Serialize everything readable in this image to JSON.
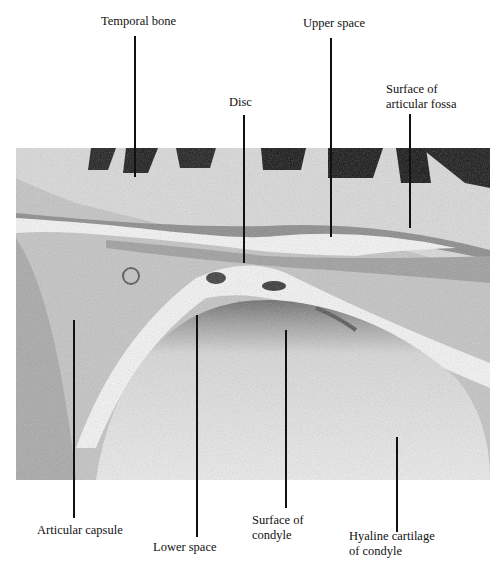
{
  "figure": {
    "image_colors": {
      "background": "#ffffff",
      "tissue_light": "#e9e9e9",
      "tissue_mid": "#b9b9b9",
      "tissue_dark": "#555555",
      "bone_dark": "#111111",
      "space": "#f6f6f6"
    }
  },
  "labels": {
    "temporal_bone": "Temporal bone",
    "upper_space": "Upper space",
    "disc": "Disc",
    "surface_of_articular_fossa": "Surface of\narticular fossa",
    "articular_capsule": "Articular capsule",
    "lower_space": "Lower space",
    "surface_of_condyle": "Surface of\ncondyle",
    "hyaline_cartilage_of_condyle": "Hyaline cartilage\nof condyle"
  }
}
